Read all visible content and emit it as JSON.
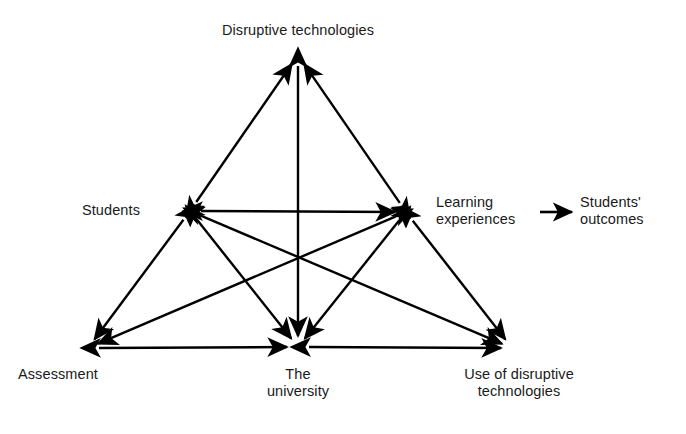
{
  "diagram": {
    "type": "network-influence-diagram",
    "background_color": "#ffffff",
    "stroke_color": "#000000",
    "nodes": [
      {
        "id": "disruptive_technologies",
        "label": "Disruptive technologies",
        "x": 298,
        "y": 55,
        "label_x": 298,
        "label_y": 22,
        "label_align": "center"
      },
      {
        "id": "students",
        "label": "Students",
        "x": 190,
        "y": 211,
        "label_x": 140,
        "label_y": 202,
        "label_align": "right"
      },
      {
        "id": "learning_experiences",
        "label": "Learning\nexperiences",
        "x": 406,
        "y": 212,
        "label_x": 436,
        "label_y": 194,
        "label_align": "left"
      },
      {
        "id": "students_outcomes",
        "label": "Students'\noutcomes",
        "x": 600,
        "y": 212,
        "label_x": 580,
        "label_y": 194,
        "label_align": "left"
      },
      {
        "id": "assessment",
        "label": "Assessment",
        "x": 88,
        "y": 348,
        "label_x": 70,
        "label_y": 366,
        "label_align": "center"
      },
      {
        "id": "the_university",
        "label": "The\nuniversity",
        "x": 298,
        "y": 347,
        "label_x": 298,
        "label_y": 366,
        "label_align": "center"
      },
      {
        "id": "use_of_disruptive_technologies",
        "label": "Use of disruptive\ntechnologies",
        "x": 512,
        "y": 348,
        "label_x": 519,
        "label_y": 366,
        "label_align": "center"
      }
    ],
    "edges": [
      {
        "id": "edge-students-disruptive",
        "from": "students",
        "to": "disruptive_technologies",
        "arrows": "both"
      },
      {
        "id": "edge-learning-disruptive",
        "from": "learning_experiences",
        "to": "disruptive_technologies",
        "arrows": "both"
      },
      {
        "id": "edge-students-learning",
        "from": "students",
        "to": "learning_experiences",
        "arrows": "both"
      },
      {
        "id": "edge-disruptive-university",
        "from": "disruptive_technologies",
        "to": "the_university",
        "arrows": "both"
      },
      {
        "id": "edge-students-assessment",
        "from": "students",
        "to": "assessment",
        "arrows": "both"
      },
      {
        "id": "edge-learning-use",
        "from": "learning_experiences",
        "to": "use_of_disruptive_technologies",
        "arrows": "both"
      },
      {
        "id": "edge-assessment-university",
        "from": "assessment",
        "to": "the_university",
        "arrows": "both"
      },
      {
        "id": "edge-university-use",
        "from": "the_university",
        "to": "use_of_disruptive_technologies",
        "arrows": "both"
      },
      {
        "id": "edge-students-university",
        "from": "students",
        "to": "the_university",
        "arrows": "both"
      },
      {
        "id": "edge-learning-university",
        "from": "learning_experiences",
        "to": "the_university",
        "arrows": "both"
      },
      {
        "id": "edge-students-use",
        "from": "students",
        "to": "use_of_disruptive_technologies",
        "arrows": "both"
      },
      {
        "id": "edge-learning-assessment",
        "from": "learning_experiences",
        "to": "assessment",
        "arrows": "both"
      },
      {
        "id": "edge-learning-outcomes",
        "from": "learning_experiences",
        "to": "students_outcomes",
        "arrows": "end",
        "x1": 540,
        "y1": 212,
        "x2": 572,
        "y2": 212
      }
    ]
  }
}
